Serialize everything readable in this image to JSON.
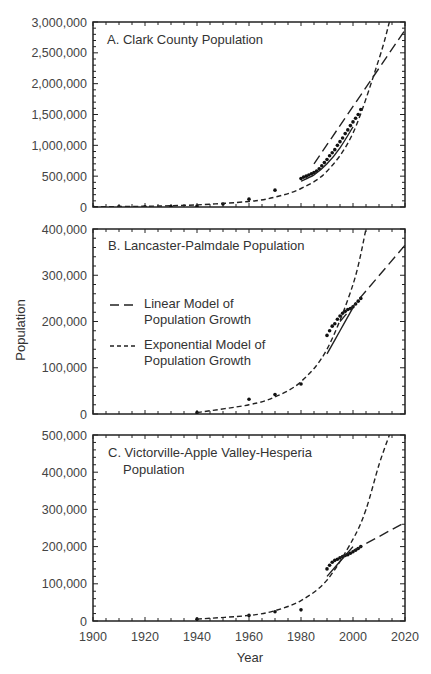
{
  "chart_data": [
    {
      "type": "scatter",
      "title": "A. Clark County Population",
      "xlabel": "Year",
      "ylabel": "Population",
      "xlim": [
        1900,
        2020
      ],
      "ylim": [
        0,
        3000000
      ],
      "yticks": [
        "0",
        "500,000",
        "1,000,000",
        "1,500,000",
        "2,000,000",
        "2,500,000",
        "3,000,000"
      ],
      "grid": false,
      "series": [
        {
          "name": "Observed population",
          "kind": "points",
          "x": [
            1900,
            1910,
            1920,
            1930,
            1940,
            1950,
            1960,
            1970,
            1980,
            1981,
            1982,
            1983,
            1984,
            1985,
            1986,
            1987,
            1988,
            1989,
            1990,
            1991,
            1992,
            1993,
            1994,
            1995,
            1996,
            1997,
            1998,
            1999,
            2000,
            2001,
            2002,
            2003
          ],
          "y": [
            0,
            3000,
            5000,
            8000,
            16000,
            48000,
            127000,
            273000,
            463000,
            485000,
            500000,
            520000,
            540000,
            560000,
            585000,
            620000,
            670000,
            720000,
            770000,
            830000,
            880000,
            930000,
            1000000,
            1060000,
            1120000,
            1190000,
            1250000,
            1320000,
            1380000,
            1440000,
            1500000,
            1580000
          ]
        },
        {
          "name": "Linear Model of Population Growth",
          "kind": "long-dash line",
          "x": [
            1985,
            2020
          ],
          "y": [
            700000,
            2870000
          ]
        },
        {
          "name": "Exponential Model of Population Growth",
          "kind": "short-dash line",
          "x": [
            1900,
            1920,
            1940,
            1960,
            1970,
            1980,
            1990,
            2000,
            2010,
            2014
          ],
          "y": [
            5000,
            12000,
            35000,
            90000,
            160000,
            300000,
            580000,
            1200000,
            2400000,
            3000000
          ]
        },
        {
          "name": "Fitted curve",
          "kind": "solid line",
          "x": [
            1980,
            1985,
            1990,
            1995,
            2000
          ],
          "y": [
            420000,
            520000,
            700000,
            960000,
            1300000
          ]
        }
      ]
    },
    {
      "type": "scatter",
      "title": "B. Lancaster-Palmdale Population",
      "xlabel": "Year",
      "ylabel": "Population",
      "xlim": [
        1900,
        2020
      ],
      "ylim": [
        0,
        400000
      ],
      "yticks": [
        "0",
        "100,000",
        "200,000",
        "300,000",
        "400,000"
      ],
      "grid": false,
      "legend": [
        "Linear Model of Population Growth",
        "Exponential Model of Population Growth"
      ],
      "legend_position": "upper left",
      "series": [
        {
          "name": "Observed population",
          "kind": "points",
          "x": [
            1940,
            1960,
            1970,
            1980,
            1990,
            1991,
            1992,
            1993,
            1994,
            1995,
            1996,
            1997,
            1998,
            1999,
            2000,
            2001,
            2002,
            2003
          ],
          "y": [
            3000,
            32000,
            42000,
            65000,
            170000,
            180000,
            190000,
            195000,
            205000,
            212000,
            218000,
            222000,
            226000,
            228000,
            232000,
            238000,
            244000,
            250000
          ]
        },
        {
          "name": "Linear Model of Population Growth",
          "kind": "long-dash line",
          "x": [
            1995,
            2020
          ],
          "y": [
            200000,
            365000
          ]
        },
        {
          "name": "Exponential Model of Population Growth",
          "kind": "short-dash line",
          "x": [
            1940,
            1960,
            1970,
            1980,
            1990,
            2000,
            2005
          ],
          "y": [
            3000,
            20000,
            37000,
            70000,
            140000,
            280000,
            400000
          ]
        },
        {
          "name": "Fitted curve",
          "kind": "solid line",
          "x": [
            1990,
            1995,
            2000
          ],
          "y": [
            130000,
            180000,
            230000
          ]
        }
      ]
    },
    {
      "type": "scatter",
      "title": "C. Victorville-Apple Valley-Hesperia Population",
      "xlabel": "Year",
      "ylabel": "Population",
      "xlim": [
        1900,
        2020
      ],
      "ylim": [
        0,
        500000
      ],
      "xticks": [
        "1900",
        "1920",
        "1940",
        "1960",
        "1980",
        "2000",
        "2020"
      ],
      "yticks": [
        "0",
        "100,000",
        "200,000",
        "300,000",
        "400,000",
        "500,000"
      ],
      "grid": false,
      "series": [
        {
          "name": "Observed population",
          "kind": "points",
          "x": [
            1940,
            1960,
            1970,
            1980,
            1990,
            1991,
            1992,
            1993,
            1994,
            1995,
            1996,
            1997,
            1998,
            1999,
            2000,
            2001,
            2002,
            2003
          ],
          "y": [
            5000,
            15000,
            25000,
            30000,
            140000,
            150000,
            158000,
            163000,
            166000,
            170000,
            173000,
            176000,
            178000,
            182000,
            186000,
            190000,
            195000,
            200000
          ]
        },
        {
          "name": "Linear Model of Population Growth",
          "kind": "long-dash line",
          "x": [
            1995,
            2020
          ],
          "y": [
            170000,
            265000
          ]
        },
        {
          "name": "Exponential Model of Population Growth",
          "kind": "short-dash line",
          "x": [
            1940,
            1960,
            1970,
            1980,
            1990,
            2000,
            2005,
            2010,
            2014
          ],
          "y": [
            5000,
            15000,
            28000,
            55000,
            110000,
            220000,
            300000,
            420000,
            500000
          ]
        },
        {
          "name": "Fitted curve",
          "kind": "solid line",
          "x": [
            1990,
            1995,
            2000
          ],
          "y": [
            120000,
            160000,
            200000
          ]
        }
      ]
    }
  ],
  "labels": {
    "panel_a_title": "A. Clark County Population",
    "panel_b_title": "B. Lancaster-Palmdale Population",
    "panel_c_title_line1": "C. Victorville-Apple Valley-Hesperia",
    "panel_c_title_line2": "Population",
    "ylabel": "Population",
    "xlabel": "Year",
    "legend_linear_line1": "Linear Model of",
    "legend_linear_line2": "Population Growth",
    "legend_exp_line1": "Exponential Model of",
    "legend_exp_line2": "Population Growth"
  },
  "axes": {
    "a_yticks": [
      "0",
      "500,000",
      "1,000,000",
      "1,500,000",
      "2,000,000",
      "2,500,000",
      "3,000,000"
    ],
    "b_yticks": [
      "0",
      "100,000",
      "200,000",
      "300,000",
      "400,000"
    ],
    "c_yticks": [
      "0",
      "100,000",
      "200,000",
      "300,000",
      "400,000",
      "500,000"
    ],
    "xticks": [
      "1900",
      "1920",
      "1940",
      "1960",
      "1980",
      "2000",
      "2020"
    ]
  }
}
